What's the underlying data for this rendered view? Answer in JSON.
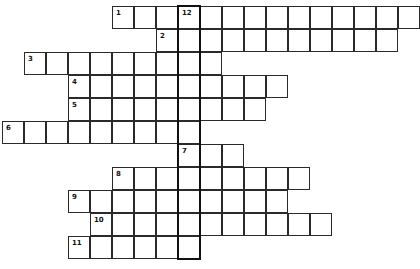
{
  "puzzle": {
    "cell_width": 22,
    "cell_height": 23,
    "origin_x": 2,
    "origin_y": 6,
    "rows": [
      {
        "clue": "1",
        "row": 0,
        "start_col": 5,
        "end_col": 18,
        "numbers": [
          {
            "col": 5,
            "label": "1"
          },
          {
            "col": 8,
            "label": "12"
          }
        ]
      },
      {
        "clue": "2",
        "row": 1,
        "start_col": 7,
        "end_col": 17,
        "numbers": [
          {
            "col": 7,
            "label": "2"
          }
        ]
      },
      {
        "clue": "3",
        "row": 2,
        "start_col": 1,
        "end_col": 9,
        "numbers": [
          {
            "col": 1,
            "label": "3"
          }
        ]
      },
      {
        "clue": "4",
        "row": 3,
        "start_col": 3,
        "end_col": 12,
        "numbers": [
          {
            "col": 3,
            "label": "4"
          }
        ]
      },
      {
        "clue": "5",
        "row": 4,
        "start_col": 3,
        "end_col": 11,
        "numbers": [
          {
            "col": 3,
            "label": "5"
          }
        ]
      },
      {
        "clue": "6",
        "row": 5,
        "start_col": 0,
        "end_col": 8,
        "numbers": [
          {
            "col": 0,
            "label": "6"
          }
        ]
      },
      {
        "clue": "7",
        "row": 6,
        "start_col": 8,
        "end_col": 10,
        "numbers": [
          {
            "col": 8,
            "label": "7"
          }
        ]
      },
      {
        "clue": "8",
        "row": 7,
        "start_col": 5,
        "end_col": 13,
        "numbers": [
          {
            "col": 5,
            "label": "8"
          }
        ]
      },
      {
        "clue": "9",
        "row": 8,
        "start_col": 3,
        "end_col": 12,
        "numbers": [
          {
            "col": 3,
            "label": "9"
          }
        ]
      },
      {
        "clue": "10",
        "row": 9,
        "start_col": 4,
        "end_col": 14,
        "numbers": [
          {
            "col": 4,
            "label": "10"
          }
        ]
      },
      {
        "clue": "11",
        "row": 10,
        "start_col": 3,
        "end_col": 8,
        "numbers": [
          {
            "col": 3,
            "label": "11"
          }
        ]
      }
    ],
    "highlight_column": {
      "clue": "12",
      "col": 8,
      "start_row": 0,
      "end_row": 10
    },
    "colors": {
      "border": "#2a2a2a",
      "highlight": "#111111",
      "background": "#ffffff"
    }
  }
}
